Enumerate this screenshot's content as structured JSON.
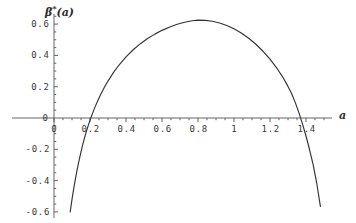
{
  "figure": {
    "background_color": "#ffffff",
    "curve_color": "#333333",
    "axis_color": "#555555",
    "text_color": "#3a3a3a"
  },
  "axes": {
    "x_axis_title": "a",
    "y_axis_title_base": "β",
    "y_axis_title_sup": "*",
    "y_axis_title_arg": "(a)",
    "y_axis_title_full": "β*(a)",
    "x_ticks": [
      {
        "value": 0,
        "label": "0"
      },
      {
        "value": 0.2,
        "label": "0.2"
      },
      {
        "value": 0.4,
        "label": "0.4"
      },
      {
        "value": 0.6,
        "label": "0.6"
      },
      {
        "value": 0.8,
        "label": "0.8"
      },
      {
        "value": 1.0,
        "label": "1"
      },
      {
        "value": 1.2,
        "label": "1.2"
      },
      {
        "value": 1.4,
        "label": "1.4"
      }
    ],
    "y_ticks": [
      {
        "value": 0.6,
        "label": "0.6"
      },
      {
        "value": 0.4,
        "label": "0.4"
      },
      {
        "value": 0.2,
        "label": "0.2"
      },
      {
        "value": 0.0,
        "label": "0"
      },
      {
        "value": -0.2,
        "label": "-0.2"
      },
      {
        "value": -0.4,
        "label": "-0.4"
      },
      {
        "value": -0.6,
        "label": "-0.6"
      }
    ]
  },
  "chart_data": {
    "type": "line",
    "title": "",
    "subtitle": "",
    "xlabel": "a",
    "ylabel": "β*(a)",
    "xlim": [
      0.0,
      1.55
    ],
    "ylim": [
      -0.62,
      0.66
    ],
    "grid": false,
    "legend": null,
    "minor_ticks": true,
    "axis_style": "crossing-axes-at-origin",
    "annotations": [],
    "roots": [
      0.245,
      1.34
    ],
    "maximum": {
      "x": 0.78,
      "y": 0.63
    },
    "series": [
      {
        "name": "β*(a)",
        "color": "#333333",
        "x": [
          0.09,
          0.1,
          0.11,
          0.12,
          0.13,
          0.14,
          0.15,
          0.16,
          0.17,
          0.18,
          0.19,
          0.2,
          0.215,
          0.23,
          0.245,
          0.26,
          0.28,
          0.3,
          0.33,
          0.36,
          0.4,
          0.44,
          0.48,
          0.52,
          0.56,
          0.6,
          0.64,
          0.68,
          0.72,
          0.76,
          0.78,
          0.8,
          0.84,
          0.88,
          0.92,
          0.96,
          1.0,
          1.04,
          1.08,
          1.12,
          1.16,
          1.2,
          1.24,
          1.27,
          1.3,
          1.32,
          1.34,
          1.36,
          1.38,
          1.4,
          1.42,
          1.44,
          1.46,
          1.48
        ],
        "y": [
          -0.6,
          -0.52,
          -0.448,
          -0.382,
          -0.322,
          -0.267,
          -0.216,
          -0.169,
          -0.126,
          -0.086,
          -0.049,
          -0.014,
          0.033,
          0.076,
          0.115,
          0.152,
          0.196,
          0.236,
          0.29,
          0.337,
          0.39,
          0.436,
          0.475,
          0.508,
          0.536,
          0.56,
          0.58,
          0.597,
          0.61,
          0.62,
          0.623,
          0.625,
          0.624,
          0.618,
          0.607,
          0.591,
          0.57,
          0.543,
          0.511,
          0.473,
          0.428,
          0.376,
          0.315,
          0.263,
          0.202,
          0.156,
          0.1,
          0.036,
          -0.036,
          -0.115,
          -0.203,
          -0.3,
          -0.42,
          -0.565
        ]
      }
    ]
  }
}
